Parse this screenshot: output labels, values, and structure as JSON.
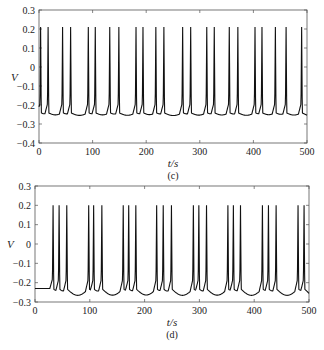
{
  "chart_data": [
    {
      "type": "line",
      "panel": "(c)",
      "xlabel": "t/s",
      "ylabel": "V",
      "xlim": [
        0,
        500
      ],
      "ylim": [
        -0.4,
        0.3
      ],
      "xticks": [
        0,
        100,
        200,
        300,
        400,
        500
      ],
      "yticks": [
        -0.4,
        -0.3,
        -0.2,
        -0.1,
        0,
        0.1,
        0.2,
        0.3
      ],
      "grid": false,
      "baseline": -0.24,
      "trough": -0.26,
      "spike_peak": 0.21,
      "spike_times": [
        3,
        17,
        44,
        59,
        92,
        105,
        132,
        149,
        181,
        194,
        218,
        233,
        268,
        283,
        313,
        327,
        355,
        371,
        403,
        416,
        441,
        461,
        490
      ],
      "box": {
        "x0": 39,
        "y0": 10,
        "x1": 307,
        "y1": 143
      }
    },
    {
      "type": "line",
      "panel": "(d)",
      "xlabel": "t/s",
      "ylabel": "V",
      "xlim": [
        0,
        500
      ],
      "ylim": [
        -0.3,
        0.3
      ],
      "xticks": [
        0,
        100,
        200,
        300,
        400,
        500
      ],
      "yticks": [
        -0.3,
        -0.2,
        -0.1,
        0,
        0.1,
        0.2,
        0.3
      ],
      "grid": false,
      "baseline": -0.23,
      "trough": -0.27,
      "spike_peak": 0.2,
      "spike_times": [
        33,
        44,
        58,
        98,
        107,
        122,
        161,
        171,
        184,
        222,
        234,
        249,
        289,
        299,
        313,
        352,
        362,
        375,
        415,
        426,
        440,
        480,
        491
      ],
      "box": {
        "x0": 35,
        "y0": 186,
        "x1": 309,
        "y1": 302
      }
    }
  ],
  "captions": {
    "c": "(c)",
    "d": "(d)"
  },
  "labels": {
    "x": "t/s",
    "y": "V"
  }
}
